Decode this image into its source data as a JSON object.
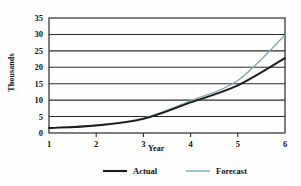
{
  "chart_data": {
    "type": "line",
    "title": "",
    "subtitle": "",
    "xlabel": "Year",
    "ylabel": "Thousands",
    "x": [
      1,
      2,
      3,
      4,
      5,
      6
    ],
    "xlim": [
      1,
      6
    ],
    "ylim": [
      0,
      35
    ],
    "xticks": [
      "1",
      "2",
      "3",
      "4",
      "5",
      "6"
    ],
    "yticks": [
      "0",
      "5",
      "10",
      "15",
      "20",
      "25",
      "30",
      "35"
    ],
    "grid": "horizontal",
    "legend_position": "bottom",
    "series": [
      {
        "name": "Actual",
        "color": "#1b1b1b",
        "values": [
          1.5,
          2.3,
          4.3,
          9.3,
          14.5,
          22.8
        ]
      },
      {
        "name": "Forecast",
        "color": "#7fa8b5",
        "values": [
          1.6,
          2.4,
          4.5,
          9.8,
          16.0,
          29.8
        ]
      }
    ],
    "annotations": []
  },
  "legend": {
    "items": [
      {
        "label": "Actual",
        "color": "#1b1b1b"
      },
      {
        "label": "Forecast",
        "color": "#7fa8b5"
      }
    ]
  },
  "axis": {
    "y_title": "Thousands",
    "x_title": "Year"
  }
}
